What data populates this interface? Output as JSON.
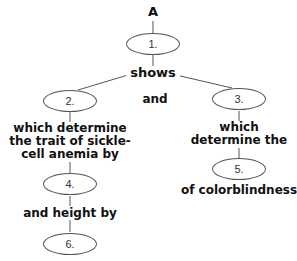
{
  "diagram": {
    "top_label": "A",
    "link_shows": "shows",
    "link_and": "and",
    "left_branch_text": [
      "which determine",
      "the trait of sickle-",
      "cell anemia by"
    ],
    "right_branch_text": [
      "which",
      "determine the"
    ],
    "link_and_height_by": "and height by",
    "link_of_colorblindness": "of colorblindness",
    "nodes": [
      {
        "id": "1",
        "label": "1."
      },
      {
        "id": "2",
        "label": "2."
      },
      {
        "id": "3",
        "label": "3."
      },
      {
        "id": "4",
        "label": "4."
      },
      {
        "id": "5",
        "label": "5."
      },
      {
        "id": "6",
        "label": "6."
      }
    ],
    "line_color": "#555555"
  }
}
